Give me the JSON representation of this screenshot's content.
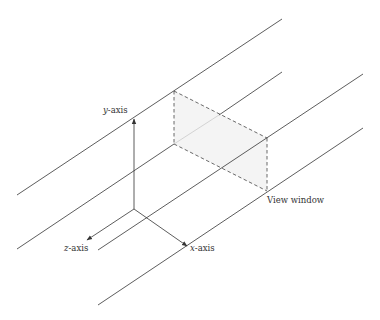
{
  "diagram": {
    "title": "",
    "labels": {
      "y_axis": {
        "var": "y",
        "suffix": "-axis"
      },
      "z_axis": {
        "var": "z",
        "suffix": "-axis"
      },
      "x_axis": {
        "var": "x",
        "suffix": "-axis"
      },
      "view_window": "View window"
    },
    "colors": {
      "line": "#333333",
      "dashed": "#444444",
      "window_fill": "#f4f4f4",
      "highlight_segment": "#cfcfcf"
    },
    "parallel_projection_lines": [
      {
        "x1": 17,
        "y1": 195,
        "x2": 282,
        "y2": 19
      },
      {
        "x1": 17,
        "y1": 249,
        "x2": 282,
        "y2": 72
      },
      {
        "x1": 98,
        "y1": 250,
        "x2": 363,
        "y2": 74
      },
      {
        "x1": 98,
        "y1": 305,
        "x2": 363,
        "y2": 128
      }
    ],
    "axes": {
      "origin": [
        134,
        209
      ],
      "y_end": [
        134,
        118
      ],
      "z_end": [
        86,
        240
      ],
      "x_end": [
        188,
        247
      ]
    },
    "view_window": {
      "top_left": [
        174,
        91
      ],
      "bottom_left": [
        174,
        144
      ],
      "top_right": [
        267,
        138
      ],
      "bottom_right": [
        267,
        191
      ]
    }
  }
}
